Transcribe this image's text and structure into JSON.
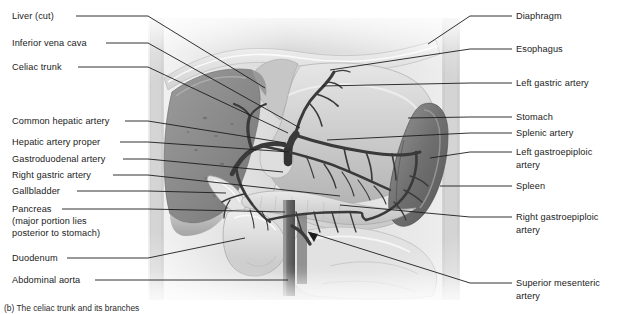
{
  "figure": {
    "caption": "(b) The celiac trunk and its branches",
    "style": {
      "background": "#ffffff",
      "label_color": "#1b1b1b",
      "leader_color": "#1c1c1c",
      "vessel_color": "#3a3a3a",
      "liver_tone": "#8c8c8c",
      "stomach_tone": "#cfcfcf",
      "spleen_tone": "#7a7a7a",
      "diaphragm_tone": "#e3e3e3",
      "body_wall_tone": "#dcdcdc"
    }
  },
  "labels_left": [
    {
      "id": "liver-cut",
      "text": "Liver (cut)",
      "x": 12,
      "y": 11,
      "leader": {
        "x1": 76,
        "y1": 16,
        "x2": 148,
        "y2": 16,
        "x3": 265,
        "y3": 88
      }
    },
    {
      "id": "inferior-vena-cava",
      "text": "Inferior vena cava",
      "x": 12,
      "y": 38,
      "leader": {
        "x1": 106,
        "y1": 43,
        "x2": 148,
        "y2": 43,
        "x3": 300,
        "y3": 128
      }
    },
    {
      "id": "celiac-trunk",
      "text": "Celiac trunk",
      "x": 12,
      "y": 62,
      "leader": {
        "x1": 78,
        "y1": 67,
        "x2": 148,
        "y2": 67,
        "x3": 288,
        "y3": 133
      }
    },
    {
      "id": "common-hepatic-artery",
      "text": "Common hepatic artery",
      "x": 12,
      "y": 116,
      "leader": {
        "x1": 125,
        "y1": 121,
        "x2": 148,
        "y2": 121,
        "x3": 286,
        "y3": 143
      }
    },
    {
      "id": "hepatic-artery-proper",
      "text": "Hepatic artery proper",
      "x": 12,
      "y": 137,
      "leader": {
        "x1": 120,
        "y1": 142,
        "x2": 148,
        "y2": 142,
        "x3": 289,
        "y3": 152
      }
    },
    {
      "id": "gastroduodenal-artery",
      "text": "Gastroduodenal artery",
      "x": 12,
      "y": 154,
      "leader": {
        "x1": 123,
        "y1": 159,
        "x2": 148,
        "y2": 159,
        "x3": 283,
        "y3": 172
      }
    },
    {
      "id": "right-gastric-artery",
      "text": "Right gastric artery",
      "x": 12,
      "y": 170,
      "leader": {
        "x1": 113,
        "y1": 175,
        "x2": 148,
        "y2": 175,
        "x3": 340,
        "y3": 196
      }
    },
    {
      "id": "gallbladder",
      "text": "Gallbladder",
      "x": 12,
      "y": 186,
      "leader": {
        "x1": 77,
        "y1": 191,
        "x2": 148,
        "y2": 191,
        "x3": 226,
        "y3": 193
      }
    },
    {
      "id": "pancreas",
      "text": "Pancreas",
      "x": 12,
      "y": 204,
      "leader": {
        "x1": 62,
        "y1": 209,
        "x2": 148,
        "y2": 209,
        "x3": 285,
        "y3": 212
      }
    },
    {
      "id": "pancreas-note-1",
      "text": "(major portion lies",
      "x": 12,
      "y": 216,
      "leader": null
    },
    {
      "id": "pancreas-note-2",
      "text": "posterior to stomach)",
      "x": 12,
      "y": 228,
      "leader": null
    },
    {
      "id": "duodenum",
      "text": "Duodenum",
      "x": 12,
      "y": 253,
      "leader": {
        "x1": 67,
        "y1": 258,
        "x2": 148,
        "y2": 258,
        "x3": 245,
        "y3": 238
      }
    },
    {
      "id": "abdominal-aorta",
      "text": "Abdominal aorta",
      "x": 12,
      "y": 275,
      "leader": {
        "x1": 95,
        "y1": 280,
        "x2": 148,
        "y2": 280,
        "x3": 288,
        "y3": 280
      }
    }
  ],
  "labels_right": [
    {
      "id": "diaphragm",
      "text": "Diaphragm",
      "x": 516,
      "y": 11,
      "leader": {
        "x1": 512,
        "y1": 16,
        "x2": 470,
        "y2": 16,
        "x3": 428,
        "y3": 44
      }
    },
    {
      "id": "esophagus",
      "text": "Esophagus",
      "x": 516,
      "y": 44,
      "leader": {
        "x1": 512,
        "y1": 49,
        "x2": 470,
        "y2": 49,
        "x3": 330,
        "y3": 70
      }
    },
    {
      "id": "left-gastric-artery",
      "text": "Left gastric artery",
      "x": 516,
      "y": 78,
      "leader": {
        "x1": 512,
        "y1": 83,
        "x2": 470,
        "y2": 83,
        "x3": 322,
        "y3": 86
      }
    },
    {
      "id": "stomach",
      "text": "Stomach",
      "x": 516,
      "y": 112,
      "leader": {
        "x1": 512,
        "y1": 117,
        "x2": 470,
        "y2": 117,
        "x3": 408,
        "y3": 118
      }
    },
    {
      "id": "splenic-artery",
      "text": "Splenic artery",
      "x": 516,
      "y": 128,
      "leader": {
        "x1": 512,
        "y1": 133,
        "x2": 470,
        "y2": 133,
        "x3": 327,
        "y3": 140
      }
    },
    {
      "id": "left-gastroepiploic-artery",
      "text": "Left gastroepiploic",
      "x": 516,
      "y": 147,
      "leader": {
        "x1": 512,
        "y1": 152,
        "x2": 470,
        "y2": 152,
        "x3": 430,
        "y3": 158
      }
    },
    {
      "id": "left-gastroepiploic-cont",
      "text": "artery",
      "x": 516,
      "y": 160,
      "leader": null
    },
    {
      "id": "spleen",
      "text": "Spleen",
      "x": 516,
      "y": 181,
      "leader": {
        "x1": 512,
        "y1": 186,
        "x2": 470,
        "y2": 186,
        "x3": 440,
        "y3": 186
      }
    },
    {
      "id": "right-gastroepiploic-artery",
      "text": "Right gastroepiploic",
      "x": 516,
      "y": 212,
      "leader": {
        "x1": 512,
        "y1": 217,
        "x2": 470,
        "y2": 217,
        "x3": 340,
        "y3": 205
      }
    },
    {
      "id": "right-gastroepiploic-cont",
      "text": "artery",
      "x": 516,
      "y": 225,
      "leader": null
    },
    {
      "id": "superior-mesenteric-artery",
      "text": "Superior mesenteric",
      "x": 516,
      "y": 278,
      "leader": {
        "x1": 512,
        "y1": 283,
        "x2": 470,
        "y2": 283,
        "x3": 308,
        "y3": 232
      }
    },
    {
      "id": "superior-mesenteric-cont",
      "text": "artery",
      "x": 516,
      "y": 291,
      "leader": null
    }
  ]
}
